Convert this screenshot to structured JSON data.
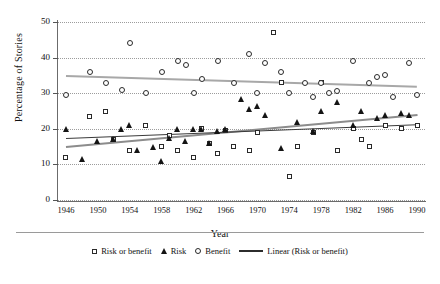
{
  "chart_data": {
    "type": "scatter",
    "title": "",
    "xlabel": "Year",
    "ylabel": "Percentage of Stories",
    "xlim": [
      1945,
      1991
    ],
    "ylim": [
      0,
      50
    ],
    "grid": true,
    "legend_position": "bottom",
    "xticks": [
      1946,
      1950,
      1954,
      1958,
      1962,
      1966,
      1970,
      1974,
      1978,
      1982,
      1986,
      1990
    ],
    "yticks": [
      0,
      10,
      20,
      30,
      40,
      50
    ],
    "series": [
      {
        "name": "Risk or benefit",
        "marker": "open-square",
        "color": "#2a2a2a",
        "points": [
          {
            "x": 1946,
            "y": 12
          },
          {
            "x": 1949,
            "y": 23.5
          },
          {
            "x": 1951,
            "y": 25
          },
          {
            "x": 1952,
            "y": 17
          },
          {
            "x": 1954,
            "y": 14
          },
          {
            "x": 1956,
            "y": 21
          },
          {
            "x": 1958,
            "y": 15
          },
          {
            "x": 1959,
            "y": 18
          },
          {
            "x": 1960,
            "y": 14
          },
          {
            "x": 1962,
            "y": 12
          },
          {
            "x": 1963,
            "y": 20
          },
          {
            "x": 1964,
            "y": 16
          },
          {
            "x": 1965,
            "y": 13
          },
          {
            "x": 1966,
            "y": 19.5
          },
          {
            "x": 1967,
            "y": 15
          },
          {
            "x": 1969,
            "y": 14
          },
          {
            "x": 1970,
            "y": 19
          },
          {
            "x": 1972,
            "y": 47
          },
          {
            "x": 1973,
            "y": 33
          },
          {
            "x": 1974,
            "y": 6.5
          },
          {
            "x": 1975,
            "y": 15
          },
          {
            "x": 1977,
            "y": 19
          },
          {
            "x": 1978,
            "y": 33
          },
          {
            "x": 1980,
            "y": 14
          },
          {
            "x": 1982,
            "y": 20
          },
          {
            "x": 1983,
            "y": 17
          },
          {
            "x": 1984,
            "y": 15
          },
          {
            "x": 1986,
            "y": 21
          },
          {
            "x": 1988,
            "y": 20
          },
          {
            "x": 1990,
            "y": 21
          }
        ]
      },
      {
        "name": "Risk",
        "marker": "filled-triangle",
        "color": "#141414",
        "points": [
          {
            "x": 1946,
            "y": 20
          },
          {
            "x": 1948,
            "y": 11.5
          },
          {
            "x": 1950,
            "y": 16.5
          },
          {
            "x": 1952,
            "y": 17
          },
          {
            "x": 1953,
            "y": 20
          },
          {
            "x": 1954,
            "y": 21
          },
          {
            "x": 1955,
            "y": 14
          },
          {
            "x": 1957,
            "y": 15
          },
          {
            "x": 1958,
            "y": 11
          },
          {
            "x": 1959,
            "y": 17.5
          },
          {
            "x": 1960,
            "y": 20
          },
          {
            "x": 1961,
            "y": 16.5
          },
          {
            "x": 1962,
            "y": 20
          },
          {
            "x": 1963,
            "y": 20
          },
          {
            "x": 1964,
            "y": 16
          },
          {
            "x": 1965,
            "y": 19.5
          },
          {
            "x": 1966,
            "y": 20
          },
          {
            "x": 1968,
            "y": 28.5
          },
          {
            "x": 1969,
            "y": 25.5
          },
          {
            "x": 1970,
            "y": 26.5
          },
          {
            "x": 1971,
            "y": 24
          },
          {
            "x": 1973,
            "y": 14.5
          },
          {
            "x": 1975,
            "y": 22
          },
          {
            "x": 1977,
            "y": 19.5
          },
          {
            "x": 1978,
            "y": 25
          },
          {
            "x": 1980,
            "y": 27.5
          },
          {
            "x": 1982,
            "y": 21
          },
          {
            "x": 1983,
            "y": 25
          },
          {
            "x": 1985,
            "y": 23
          },
          {
            "x": 1986,
            "y": 24
          },
          {
            "x": 1988,
            "y": 24.5
          },
          {
            "x": 1989,
            "y": 24
          }
        ]
      },
      {
        "name": "Benefit",
        "marker": "open-circle",
        "color": "#2a2a2a",
        "points": [
          {
            "x": 1946,
            "y": 29.5
          },
          {
            "x": 1949,
            "y": 36
          },
          {
            "x": 1951,
            "y": 33
          },
          {
            "x": 1953,
            "y": 31
          },
          {
            "x": 1954,
            "y": 44
          },
          {
            "x": 1956,
            "y": 30
          },
          {
            "x": 1958,
            "y": 36
          },
          {
            "x": 1960,
            "y": 39
          },
          {
            "x": 1961,
            "y": 38
          },
          {
            "x": 1962,
            "y": 30
          },
          {
            "x": 1963,
            "y": 34
          },
          {
            "x": 1965,
            "y": 39
          },
          {
            "x": 1967,
            "y": 33
          },
          {
            "x": 1969,
            "y": 41
          },
          {
            "x": 1970,
            "y": 30
          },
          {
            "x": 1971,
            "y": 38.5
          },
          {
            "x": 1973,
            "y": 36
          },
          {
            "x": 1974,
            "y": 30
          },
          {
            "x": 1976,
            "y": 33
          },
          {
            "x": 1977,
            "y": 29
          },
          {
            "x": 1978,
            "y": 33
          },
          {
            "x": 1979,
            "y": 30
          },
          {
            "x": 1980,
            "y": 30.5
          },
          {
            "x": 1982,
            "y": 39
          },
          {
            "x": 1984,
            "y": 33
          },
          {
            "x": 1985,
            "y": 34.5
          },
          {
            "x": 1986,
            "y": 35
          },
          {
            "x": 1987,
            "y": 29
          },
          {
            "x": 1989,
            "y": 38.5
          },
          {
            "x": 1990,
            "y": 29.5
          }
        ]
      }
    ],
    "trendlines": [
      {
        "name": "Linear (Benefit)",
        "x0": 1946,
        "y0": 35.2,
        "x1": 1990,
        "y1": 32.2,
        "color": "#a8a8a8",
        "width": 1.7
      },
      {
        "name": "Linear (Risk)",
        "x0": 1946,
        "y0": 15.2,
        "x1": 1990,
        "y1": 24.2,
        "color": "#8c8c8c",
        "width": 2.4
      },
      {
        "name": "Linear (Risk or benefit)",
        "x0": 1946,
        "y0": 17.4,
        "x1": 1990,
        "y1": 21.3,
        "color": "#3a3a3a",
        "width": 1.2
      }
    ],
    "legend": [
      {
        "label": "Risk or benefit",
        "marker": "open-square"
      },
      {
        "label": "Risk",
        "marker": "filled-triangle"
      },
      {
        "label": "Benefit",
        "marker": "open-circle"
      },
      {
        "label": "Linear (Risk or benefit)",
        "marker": "line"
      }
    ]
  }
}
